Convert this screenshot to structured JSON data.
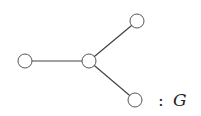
{
  "graph": {
    "label_colon": ":",
    "label_name": "G",
    "edge_color": "#444444",
    "node_stroke": "#555555",
    "node_fill": "#ffffff",
    "nodes": [
      {
        "id": "left",
        "x": 25,
        "y": 61
      },
      {
        "id": "center",
        "x": 89,
        "y": 61
      },
      {
        "id": "top-right",
        "x": 137,
        "y": 21
      },
      {
        "id": "bottom-right",
        "x": 135,
        "y": 100
      }
    ],
    "edges": [
      [
        "left",
        "center"
      ],
      [
        "center",
        "top-right"
      ],
      [
        "center",
        "bottom-right"
      ]
    ]
  }
}
